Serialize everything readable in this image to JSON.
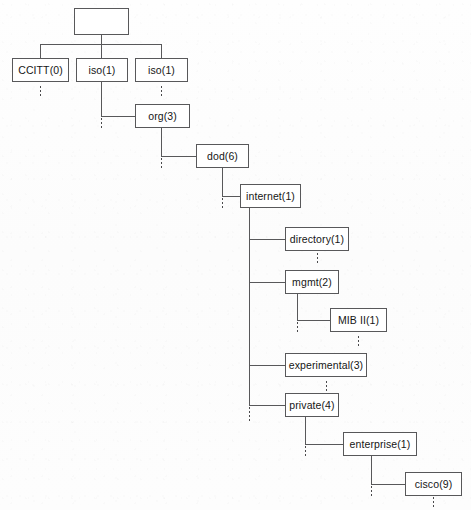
{
  "diagram": {
    "type": "hierarchical-tree",
    "line_color": "#58585a",
    "box_fill": "#ffffff",
    "text_color": "#161616",
    "background": "#fdfdfd",
    "nodes": [
      {
        "id": "root",
        "label": "",
        "x": 74,
        "y": 8,
        "w": 55,
        "h": 27
      },
      {
        "id": "ccitt",
        "label": "CCITT(0)",
        "x": 12,
        "y": 58,
        "w": 57,
        "h": 24
      },
      {
        "id": "iso1",
        "label": "iso(1)",
        "x": 76,
        "y": 58,
        "w": 52,
        "h": 24
      },
      {
        "id": "iso2",
        "label": "iso(1)",
        "x": 135,
        "y": 58,
        "w": 53,
        "h": 24
      },
      {
        "id": "org",
        "label": "org(3)",
        "x": 135,
        "y": 104,
        "w": 55,
        "h": 24
      },
      {
        "id": "dod",
        "label": "dod(6)",
        "x": 196,
        "y": 144,
        "w": 53,
        "h": 24
      },
      {
        "id": "internet",
        "label": "internet(1)",
        "x": 240,
        "y": 184,
        "w": 61,
        "h": 24
      },
      {
        "id": "directory",
        "label": "directory(1)",
        "x": 285,
        "y": 227,
        "w": 64,
        "h": 24
      },
      {
        "id": "mgmt",
        "label": "mgmt(2)",
        "x": 285,
        "y": 270,
        "w": 54,
        "h": 24
      },
      {
        "id": "mib2",
        "label": "MIB II(1)",
        "x": 330,
        "y": 308,
        "w": 57,
        "h": 24
      },
      {
        "id": "experimental",
        "label": "experimental(3)",
        "x": 285,
        "y": 353,
        "w": 82,
        "h": 24
      },
      {
        "id": "private",
        "label": "private(4)",
        "x": 285,
        "y": 393,
        "w": 54,
        "h": 24
      },
      {
        "id": "enterprise",
        "label": "enterprise(1)",
        "x": 343,
        "y": 432,
        "w": 74,
        "h": 24
      },
      {
        "id": "cisco",
        "label": "cisco(9)",
        "x": 405,
        "y": 472,
        "w": 57,
        "h": 24
      }
    ],
    "hierarchy": {
      "root": [
        "CCITT(0)",
        "iso(1)",
        "iso(1)"
      ],
      "iso(1)": [
        "org(3)"
      ],
      "org(3)": [
        "dod(6)"
      ],
      "dod(6)": [
        "internet(1)"
      ],
      "internet(1)": [
        "directory(1)",
        "mgmt(2)",
        "experimental(3)",
        "private(4)"
      ],
      "mgmt(2)": [
        "MIB II(1)"
      ],
      "private(4)": [
        "enterprise(1)"
      ],
      "enterprise(1)": [
        "cisco(9)"
      ]
    },
    "edges": [
      {
        "name": "root-drop",
        "orient": "v",
        "x": 101,
        "y": 35,
        "len": 9
      },
      {
        "name": "root-bus",
        "orient": "h",
        "x": 40,
        "y": 44,
        "len": 122
      },
      {
        "name": "bus-to-ccitt",
        "orient": "v",
        "x": 40,
        "y": 44,
        "len": 14
      },
      {
        "name": "bus-to-iso1",
        "orient": "v",
        "x": 101,
        "y": 44,
        "len": 14
      },
      {
        "name": "bus-to-iso2",
        "orient": "v",
        "x": 161,
        "y": 44,
        "len": 14
      },
      {
        "name": "iso1-drop",
        "orient": "v",
        "x": 101,
        "y": 82,
        "len": 34
      },
      {
        "name": "iso1-to-org",
        "orient": "h",
        "x": 101,
        "y": 116,
        "len": 34
      },
      {
        "name": "org-drop",
        "orient": "v",
        "x": 161,
        "y": 128,
        "len": 28
      },
      {
        "name": "org-to-dod",
        "orient": "h",
        "x": 161,
        "y": 156,
        "len": 35
      },
      {
        "name": "dod-drop",
        "orient": "v",
        "x": 222,
        "y": 168,
        "len": 28
      },
      {
        "name": "dod-to-internet",
        "orient": "h",
        "x": 222,
        "y": 196,
        "len": 18
      },
      {
        "name": "internet-drop",
        "orient": "v",
        "x": 249,
        "y": 208,
        "len": 197
      },
      {
        "name": "internet-to-directory",
        "orient": "h",
        "x": 249,
        "y": 239,
        "len": 36
      },
      {
        "name": "internet-to-mgmt",
        "orient": "h",
        "x": 249,
        "y": 282,
        "len": 36
      },
      {
        "name": "internet-to-exper",
        "orient": "h",
        "x": 249,
        "y": 365,
        "len": 36
      },
      {
        "name": "internet-to-private",
        "orient": "h",
        "x": 249,
        "y": 405,
        "len": 36
      },
      {
        "name": "mgmt-drop",
        "orient": "v",
        "x": 297,
        "y": 294,
        "len": 26
      },
      {
        "name": "mgmt-to-mib2",
        "orient": "h",
        "x": 297,
        "y": 320,
        "len": 33
      },
      {
        "name": "private-drop",
        "orient": "v",
        "x": 305,
        "y": 417,
        "len": 27
      },
      {
        "name": "private-to-enterprise",
        "orient": "h",
        "x": 305,
        "y": 444,
        "len": 38
      },
      {
        "name": "enterprise-drop",
        "orient": "v",
        "x": 371,
        "y": 456,
        "len": 28
      },
      {
        "name": "enterprise-to-cisco",
        "orient": "h",
        "x": 371,
        "y": 484,
        "len": 34
      }
    ],
    "continuation_marks": [
      {
        "name": "ccitt-more",
        "x": 40,
        "y": 86,
        "len": 12
      },
      {
        "name": "iso2-more",
        "x": 161,
        "y": 86,
        "len": 12
      },
      {
        "name": "iso1-bus-more",
        "x": 101,
        "y": 118,
        "len": 12
      },
      {
        "name": "org-bus-more",
        "x": 161,
        "y": 158,
        "len": 12
      },
      {
        "name": "dod-bus-more",
        "x": 222,
        "y": 198,
        "len": 12
      },
      {
        "name": "directory-more",
        "x": 317,
        "y": 253,
        "len": 12
      },
      {
        "name": "mgmt-bus-more",
        "x": 297,
        "y": 322,
        "len": 12
      },
      {
        "name": "mib2-more",
        "x": 358,
        "y": 336,
        "len": 12
      },
      {
        "name": "experimental-more",
        "x": 326,
        "y": 381,
        "len": 12
      },
      {
        "name": "internet-bus-more",
        "x": 249,
        "y": 407,
        "len": 14
      },
      {
        "name": "private-bus-more",
        "x": 305,
        "y": 446,
        "len": 12
      },
      {
        "name": "enterprise-bus-more",
        "x": 371,
        "y": 486,
        "len": 12
      },
      {
        "name": "cisco-more",
        "x": 433,
        "y": 497,
        "len": 11
      }
    ]
  }
}
